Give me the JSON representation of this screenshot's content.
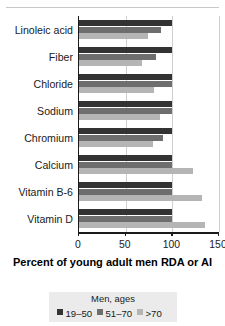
{
  "caption": {
    "text": "TABLE 13-1 The Intakes and Needs of Older Adults"
  },
  "chart_data": {
    "type": "bar",
    "orientation": "horizontal",
    "title": "",
    "xlabel": "Percent of young adult men RDA or AI",
    "ylabel": "",
    "xlim": [
      0,
      150
    ],
    "xticks": [
      0,
      50,
      100,
      150
    ],
    "xticklabels": [
      "0",
      "50",
      "100",
      "150"
    ],
    "grid": "vertical",
    "categories": [
      "Linoleic acid",
      "Fiber",
      "Chloride",
      "Sodium",
      "Chromium",
      "Calcium",
      "Vitamin B-6",
      "Vitamin D"
    ],
    "series": [
      {
        "name": "19-50",
        "color": "#333333",
        "values": [
          100,
          100,
          100,
          100,
          100,
          100,
          100,
          100
        ]
      },
      {
        "name": "51-70",
        "color": "#6e6e6e",
        "values": [
          88,
          83,
          100,
          100,
          90,
          100,
          100,
          100
        ]
      },
      {
        "name": ">70",
        "color": "#b5b5b5",
        "values": [
          74,
          68,
          80,
          87,
          79,
          122,
          132,
          135
        ]
      }
    ],
    "legend": {
      "position": "bottom",
      "title": "Men, ages",
      "entries": [
        {
          "label": "19–50",
          "color": "#333333"
        },
        {
          "label": "51–70",
          "color": "#6e6e6e"
        },
        {
          "label": ">70",
          "color": "#b5b5b5"
        }
      ]
    }
  }
}
